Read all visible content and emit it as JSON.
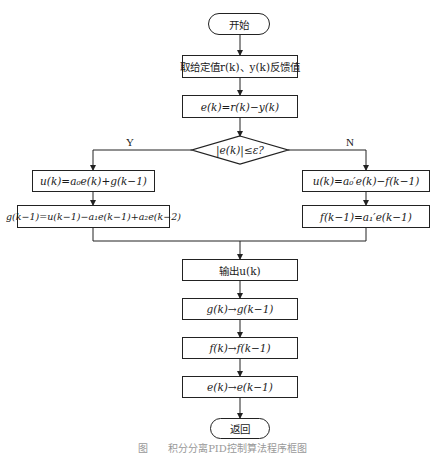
{
  "flowchart": {
    "start": "开始",
    "step_read": "取给定值r(k)、y(k)反馈值",
    "step_error": "e(k)=r(k)−y(k)",
    "decision": "|e(k)|≤ε?",
    "branch_yes_label": "Y",
    "branch_no_label": "N",
    "yes_branch": [
      "u(k)=a₀e(k)+g(k−1)",
      "g(k−1)=u(k−1)−a₁e(k−1)+a₂e(k−2)"
    ],
    "no_branch": [
      "u(k)=a₀′e(k)−f(k−1)",
      "f(k−1)=a₁′e(k−1)"
    ],
    "step_output": "输出u(k)",
    "step_shift_g": "g(k)→g(k−1)",
    "step_shift_f": "f(k)→f(k−1)",
    "step_shift_e": "e(k)→e(k−1)",
    "end": "返回"
  },
  "caption": "图　　积分分离PID控制算法程序框图",
  "colors": {
    "line": "#222222",
    "background": "#ffffff",
    "caption": "#999999"
  }
}
